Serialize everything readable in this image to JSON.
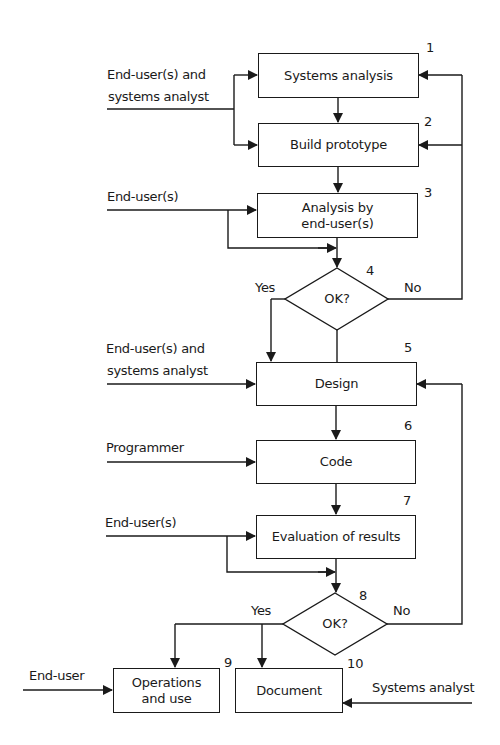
{
  "diagram": {
    "type": "flowchart",
    "nodes": [
      {
        "id": "1",
        "number": "1",
        "label": "Systems analysis",
        "shape": "box"
      },
      {
        "id": "2",
        "number": "2",
        "label": "Build prototype",
        "shape": "box"
      },
      {
        "id": "3",
        "number": "3",
        "label_line1": "Analysis by",
        "label_line2": "end-user(s)",
        "shape": "box"
      },
      {
        "id": "4",
        "number": "4",
        "label": "OK?",
        "shape": "decision",
        "yes": "Yes",
        "no": "No"
      },
      {
        "id": "5",
        "number": "5",
        "label": "Design",
        "shape": "box"
      },
      {
        "id": "6",
        "number": "6",
        "label": "Code",
        "shape": "box"
      },
      {
        "id": "7",
        "number": "7",
        "label": "Evaluation of results",
        "shape": "box"
      },
      {
        "id": "8",
        "number": "8",
        "label": "OK?",
        "shape": "decision",
        "yes": "Yes",
        "no": "No"
      },
      {
        "id": "9",
        "number": "9",
        "label_line1": "Operations",
        "label_line2": "and use",
        "shape": "box"
      },
      {
        "id": "10",
        "number": "10",
        "label": "Document",
        "shape": "box"
      }
    ],
    "inputs": {
      "step1": {
        "line1": "End-user(s) and",
        "line2": "systems analyst"
      },
      "step3": "End-user(s)",
      "step5": {
        "line1": "End-user(s) and",
        "line2": "systems analyst"
      },
      "step6": "Programmer",
      "step7": "End-user(s)",
      "step9": "End-user",
      "step10": "Systems analyst"
    },
    "edges": [
      {
        "from": "1",
        "to": "2"
      },
      {
        "from": "2",
        "to": "3"
      },
      {
        "from": "3",
        "to": "4"
      },
      {
        "from": "4",
        "to": "5",
        "label": "Yes"
      },
      {
        "from": "4",
        "to": "1",
        "label": "No"
      },
      {
        "from": "4",
        "to": "2",
        "label": "No"
      },
      {
        "from": "5",
        "to": "6"
      },
      {
        "from": "6",
        "to": "7"
      },
      {
        "from": "7",
        "to": "8"
      },
      {
        "from": "8",
        "to": "9",
        "label": "Yes"
      },
      {
        "from": "8",
        "to": "10",
        "label": "Yes"
      },
      {
        "from": "8",
        "to": "5",
        "label": "No"
      }
    ]
  }
}
